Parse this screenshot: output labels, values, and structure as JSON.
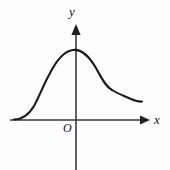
{
  "figure": {
    "kind": "cartesian-coordinate-graph",
    "background_color": "#fdfdfd",
    "stroke_color": "#1a1a1a",
    "axis_color": "#3a3a3a",
    "labels": {
      "y_axis": "y",
      "x_axis": "x",
      "origin": "O"
    }
  },
  "chart_data": {
    "type": "line",
    "title": "",
    "xlabel": "x",
    "ylabel": "y",
    "grid": false,
    "legend": null,
    "axes": {
      "origin_px": [
        76,
        120
      ],
      "x_axis_start_px": [
        10,
        120
      ],
      "x_axis_arrow_tip_px": [
        150,
        120
      ],
      "y_axis_arrow_tip_px": [
        76,
        25
      ],
      "y_axis_bottom_px": [
        76,
        170
      ],
      "x_direction": "right",
      "y_direction": "up",
      "tick_labels_x": [],
      "tick_labels_y": []
    },
    "features": [
      {
        "name": "left-asymptotic-tail",
        "x_px": 15,
        "y_px": 119
      },
      {
        "name": "left-inflection",
        "x_px": 40,
        "y_px": 93
      },
      {
        "name": "global-maximum",
        "x_px": 73,
        "y_px": 50
      },
      {
        "name": "right-inflection",
        "x_px": 100,
        "y_px": 72
      },
      {
        "name": "shoulder-plateau",
        "x_px": 118,
        "y_px": 92
      },
      {
        "name": "local-minimum",
        "x_px": 131,
        "y_px": 99
      },
      {
        "name": "curve-endpoint",
        "x_px": 142,
        "y_px": 102
      }
    ],
    "curve_path": "M 14 119.5 C 22 119.5, 28 116, 34 106 C 39 97, 43 86, 49 75 C 55 63, 63 51, 73 50 C 83 49, 90 58, 96 68 C 101 77, 105 86, 112 90 C 118 94, 125 96, 131 99 C 136 101, 139 102, 142 101.5",
    "series": [
      {
        "name": "curve",
        "x": [
          14,
          20,
          26,
          32,
          38,
          44,
          50,
          56,
          62,
          68,
          73,
          78,
          84,
          90,
          96,
          102,
          108,
          114,
          120,
          126,
          131,
          136,
          142
        ],
        "y_px": [
          119.5,
          119,
          116.5,
          111,
          101,
          90,
          79,
          68,
          58,
          52,
          50,
          50,
          54,
          61,
          68,
          76,
          84,
          89,
          93,
          97,
          99,
          101,
          101.5
        ]
      }
    ]
  }
}
